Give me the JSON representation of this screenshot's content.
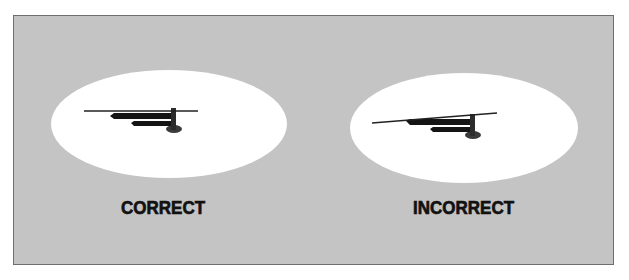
{
  "figure": {
    "background_color": "#c4c4c4",
    "border_color": "#6e6e6e",
    "panels": [
      {
        "id": "correct",
        "label": "CORRECT",
        "ellipse": {
          "cx": 169,
          "cy": 124,
          "rx": 118,
          "ry": 54,
          "fill": "#ffffff"
        },
        "needle": {
          "x1": 84,
          "y1": 111,
          "x2": 198,
          "y2": 111,
          "angle": "level"
        }
      },
      {
        "id": "incorrect",
        "label": "INCORRECT",
        "ellipse": {
          "cx": 464,
          "cy": 128,
          "rx": 114,
          "ry": 55,
          "fill": "#ffffff"
        },
        "needle": {
          "x1": 372,
          "y1": 123,
          "x2": 497,
          "y2": 113,
          "angle": "tilted"
        }
      }
    ]
  }
}
